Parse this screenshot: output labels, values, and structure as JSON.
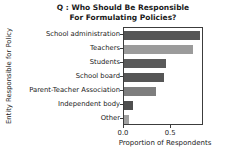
{
  "chart_data": {
    "type": "bar",
    "orientation": "horizontal",
    "title": "Q : Who Should Be Responsible For Formulating Policies?",
    "title_line1": "Q : Who Should Be Responsible",
    "title_line2": "For Formulating Policies?",
    "categories": [
      "School administration",
      "Teachers",
      "Students",
      "School board",
      "Parent-Teacher Association",
      "Independent body",
      "Other"
    ],
    "values": [
      0.81,
      0.73,
      0.45,
      0.43,
      0.34,
      0.1,
      0.05
    ],
    "bar_colors": [
      "#565656",
      "#9b9b9b",
      "#5a5a5a",
      "#565656",
      "#7e7e7e",
      "#4f4f4f",
      "#a0a0a0"
    ],
    "xlabel": "Proportion of Respondents",
    "ylabel": "Entity Responsible for Policy",
    "xlim": [
      0,
      0.85
    ],
    "xticks": [
      {
        "label": "0.0",
        "value": 0.0
      },
      {
        "label": "0.5",
        "value": 0.5
      }
    ],
    "grid": false,
    "legend": "none",
    "spine_color": "#3c3c3c"
  }
}
